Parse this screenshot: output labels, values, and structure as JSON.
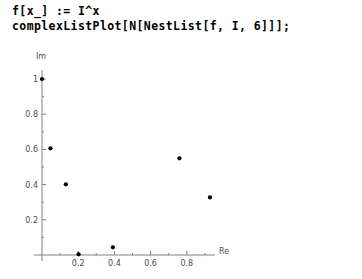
{
  "code": {
    "lines": [
      "f[x_] := I^x",
      "complexListPlot[N[NestList[f, I, 6]]];"
    ]
  },
  "chart_data": {
    "type": "scatter",
    "title": "",
    "xlabel": "Re",
    "ylabel": "Im",
    "xlim": [
      0,
      1.0
    ],
    "ylim": [
      0,
      1.05
    ],
    "grid": false,
    "legend": false,
    "marker": "filled-circle",
    "marker_color": "#000000",
    "axis_color": "#808080",
    "x_ticks": [
      0.2,
      0.4,
      0.6,
      0.8
    ],
    "x_tick_labels": [
      "0.2",
      "0.4",
      "0.6",
      "0.8"
    ],
    "y_ticks": [
      0.2,
      0.4,
      0.6,
      0.8,
      1
    ],
    "y_tick_labels": [
      "0.2",
      "0.4",
      "0.6",
      "0.8",
      "1"
    ],
    "points": [
      {
        "x": 0.0,
        "y": 1.0
      },
      {
        "x": 0.0468,
        "y": 0.6063
      },
      {
        "x": 0.1318,
        "y": 0.4017
      },
      {
        "x": 0.2022,
        "y": 0.0037
      },
      {
        "x": 0.3917,
        "y": 0.0436
      },
      {
        "x": 0.7595,
        "y": 0.5495
      },
      {
        "x": 0.9281,
        "y": 0.3269
      }
    ]
  }
}
